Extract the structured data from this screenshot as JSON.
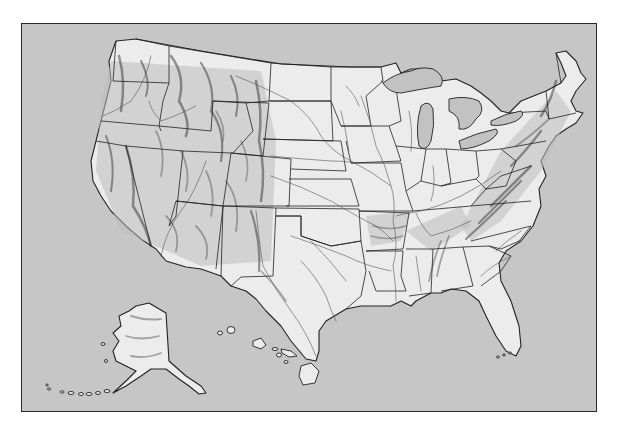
{
  "map": {
    "subject": "United States physical relief map",
    "regions": [
      "contiguous-united-states",
      "alaska",
      "hawaii"
    ],
    "features": [
      "state-boundaries",
      "rivers",
      "great-lakes",
      "mountain-relief-shading"
    ],
    "labels": []
  },
  "colors": {
    "page_background": "#ffffff",
    "water": "#c6c6c6",
    "land": "#ececec",
    "border": "#222222",
    "relief": "#555555"
  },
  "frame": {
    "x": 21,
    "y": 23,
    "width": 576,
    "height": 389
  }
}
